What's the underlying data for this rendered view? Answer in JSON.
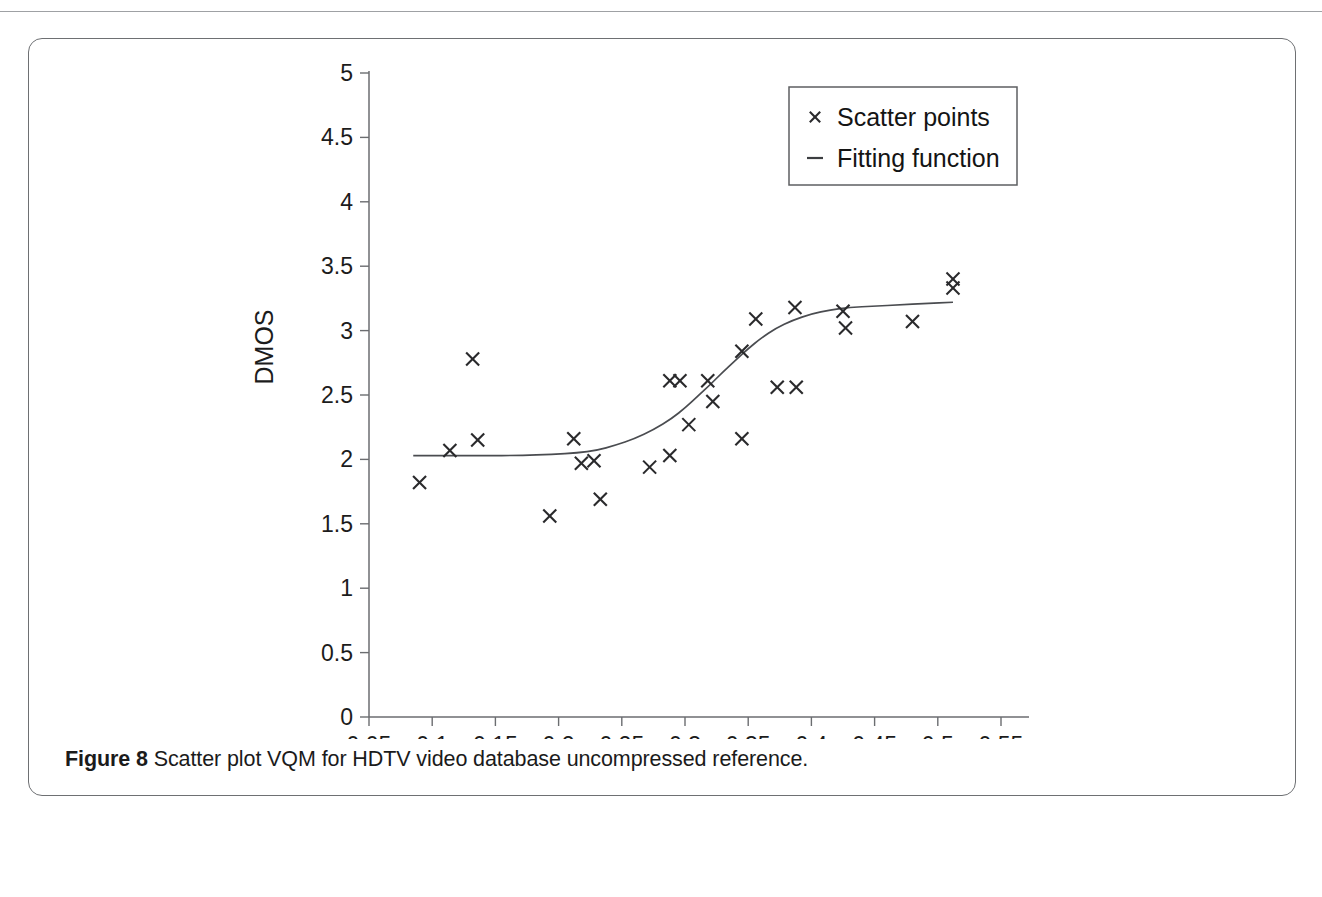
{
  "figure": {
    "caption_label": "Figure 8",
    "caption_text": " Scatter plot VQM for HDTV video database uncompressed reference."
  },
  "chart_data": {
    "type": "scatter",
    "title": "",
    "xlabel": "VQM",
    "ylabel": "DMOS",
    "xlim": [
      0.05,
      0.55
    ],
    "ylim": [
      0,
      5
    ],
    "xticks": [
      "0.05",
      "0.1",
      "0.15",
      "0.2",
      "0.25",
      "0.3",
      "0.35",
      "0.4",
      "0.45",
      "0.5",
      "0.55"
    ],
    "xtick_values": [
      0.05,
      0.1,
      0.15,
      0.2,
      0.25,
      0.3,
      0.35,
      0.4,
      0.45,
      0.5,
      0.55
    ],
    "yticks": [
      "0",
      "0.5",
      "1",
      "1.5",
      "2",
      "2.5",
      "3",
      "3.5",
      "4",
      "4.5",
      "5"
    ],
    "ytick_values": [
      0,
      0.5,
      1,
      1.5,
      2,
      2.5,
      3,
      3.5,
      4,
      4.5,
      5
    ],
    "grid": false,
    "legend_position": "top-right",
    "legend": [
      {
        "label": "Scatter points",
        "marker": "x"
      },
      {
        "label": "Fitting function",
        "marker": "line"
      }
    ],
    "series": [
      {
        "name": "Scatter points",
        "marker": "x",
        "points": [
          [
            0.09,
            1.82
          ],
          [
            0.114,
            2.07
          ],
          [
            0.136,
            2.15
          ],
          [
            0.132,
            2.78
          ],
          [
            0.193,
            1.56
          ],
          [
            0.212,
            2.16
          ],
          [
            0.218,
            1.97
          ],
          [
            0.228,
            1.99
          ],
          [
            0.233,
            1.69
          ],
          [
            0.272,
            1.94
          ],
          [
            0.288,
            2.61
          ],
          [
            0.288,
            2.03
          ],
          [
            0.296,
            2.61
          ],
          [
            0.303,
            2.27
          ],
          [
            0.318,
            2.61
          ],
          [
            0.322,
            2.45
          ],
          [
            0.345,
            2.16
          ],
          [
            0.345,
            2.84
          ],
          [
            0.356,
            3.09
          ],
          [
            0.373,
            2.56
          ],
          [
            0.387,
            3.18
          ],
          [
            0.388,
            2.56
          ],
          [
            0.425,
            3.15
          ],
          [
            0.427,
            3.02
          ],
          [
            0.48,
            3.07
          ],
          [
            0.512,
            3.4
          ],
          [
            0.512,
            3.33
          ]
        ]
      },
      {
        "name": "Fitting function",
        "marker": "line",
        "points": [
          [
            0.085,
            2.03
          ],
          [
            0.11,
            2.03
          ],
          [
            0.14,
            2.03
          ],
          [
            0.17,
            2.03
          ],
          [
            0.195,
            2.04
          ],
          [
            0.215,
            2.05
          ],
          [
            0.23,
            2.07
          ],
          [
            0.245,
            2.11
          ],
          [
            0.26,
            2.16
          ],
          [
            0.275,
            2.23
          ],
          [
            0.29,
            2.32
          ],
          [
            0.3,
            2.4
          ],
          [
            0.31,
            2.49
          ],
          [
            0.32,
            2.58
          ],
          [
            0.33,
            2.68
          ],
          [
            0.34,
            2.77
          ],
          [
            0.35,
            2.86
          ],
          [
            0.36,
            2.94
          ],
          [
            0.372,
            3.02
          ],
          [
            0.385,
            3.08
          ],
          [
            0.4,
            3.13
          ],
          [
            0.415,
            3.16
          ],
          [
            0.43,
            3.18
          ],
          [
            0.45,
            3.19
          ],
          [
            0.47,
            3.2
          ],
          [
            0.49,
            3.21
          ],
          [
            0.512,
            3.22
          ]
        ]
      }
    ]
  }
}
